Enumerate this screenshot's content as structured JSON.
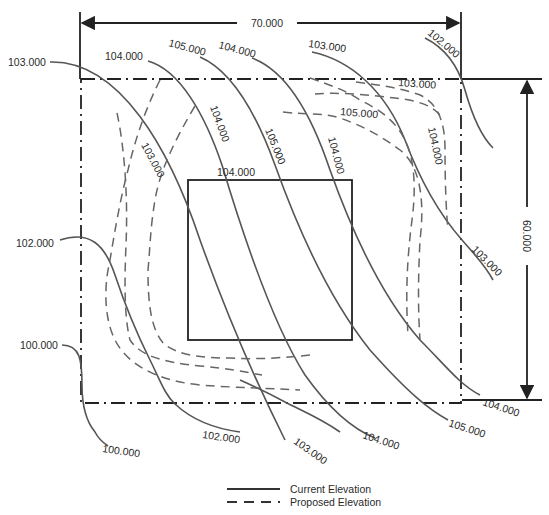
{
  "diagram": {
    "type": "site grading contour plan",
    "dimensions": {
      "width_label": "70.000",
      "height_label": "60.000"
    },
    "building": {
      "label": "104.000"
    },
    "current_contours": [
      {
        "id": "c103-left",
        "label": "103.000"
      },
      {
        "id": "c104-top",
        "label": "104.000"
      },
      {
        "id": "c105-top",
        "label": "105.000"
      },
      {
        "id": "c104-top2",
        "label": "104.000"
      },
      {
        "id": "c103-top",
        "label": "103.000"
      },
      {
        "id": "c102-top",
        "label": "102.000"
      },
      {
        "id": "c102-left",
        "label": "102.000"
      },
      {
        "id": "c100-left",
        "label": "100.000"
      },
      {
        "id": "c100-bottom",
        "label": "100.000"
      },
      {
        "id": "c102-bottom",
        "label": "102.000"
      },
      {
        "id": "c103-bottom",
        "label": "103.000"
      },
      {
        "id": "c104-bottom",
        "label": "104.000"
      },
      {
        "id": "c105-bottom",
        "label": "105.000"
      },
      {
        "id": "c104-bottom-right",
        "label": "104.000"
      },
      {
        "id": "c103-right",
        "label": "103.000"
      }
    ],
    "inline_labels": {
      "c103_diag": "103.000",
      "c104_diag": "104.000",
      "c105_diag": "105.000",
      "c104_diag2": "104.000",
      "p103_top": "103.000",
      "p105_mid": "105.000",
      "p104_right": "104.000"
    },
    "legend": {
      "current": "Current Elevation",
      "proposed": "Proposed Elevation"
    },
    "colors": {
      "current_line": "#555555",
      "proposed_line": "#666666",
      "boundary": "#222222"
    }
  }
}
